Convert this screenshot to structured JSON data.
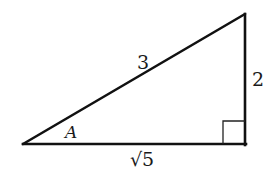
{
  "diagram": {
    "type": "right-triangle",
    "colors": {
      "stroke": "#111111",
      "text": "#1a1a1a",
      "background": "#ffffff"
    },
    "vertices": {
      "angle_A": {
        "x": 23,
        "y": 144
      },
      "right_angle": {
        "x": 245,
        "y": 144
      },
      "top": {
        "x": 245,
        "y": 14
      }
    },
    "labels": {
      "hypotenuse": "3",
      "opposite_side": "2",
      "adjacent_side": "√5",
      "angle": "A"
    },
    "right_angle_marker": true
  }
}
